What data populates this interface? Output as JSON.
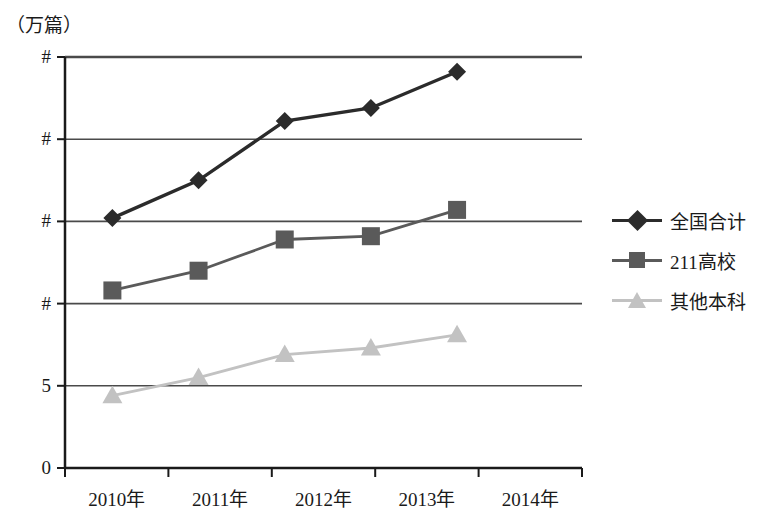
{
  "chart_data": {
    "type": "line",
    "title": "",
    "subtitle": "",
    "unit_label": "（万篇）",
    "xlabel": "",
    "ylabel": "",
    "categories": [
      "2010年",
      "2011年",
      "2012年",
      "2013年",
      "2014年"
    ],
    "ytick_labels": [
      "#",
      "#",
      "#",
      "#",
      "5",
      "0"
    ],
    "ytick_values": [
      25,
      20,
      15,
      10,
      5,
      0
    ],
    "ylim": [
      0,
      25
    ],
    "grid": true,
    "legend_position": "right",
    "series": [
      {
        "name": "全国合计",
        "marker": "diamond",
        "color": "#2b2b2b",
        "values": [
          15.2,
          17.5,
          21.1,
          21.9,
          24.1
        ]
      },
      {
        "name": "211高校",
        "marker": "square",
        "color": "#5a5a5a",
        "values": [
          10.8,
          12.0,
          13.9,
          14.1,
          15.7
        ]
      },
      {
        "name": "其他本科",
        "marker": "triangle",
        "color": "#c2c2c2",
        "values": [
          4.4,
          5.5,
          6.9,
          7.3,
          8.1
        ]
      }
    ]
  },
  "axis": {
    "x_tick_count": 6,
    "baseline_label": "0"
  },
  "legend": {
    "items": [
      {
        "label": "全国合计",
        "marker": "diamond",
        "color": "#2b2b2b"
      },
      {
        "label": "211高校",
        "marker": "square",
        "color": "#5a5a5a"
      },
      {
        "label": "其他本科",
        "marker": "triangle",
        "color": "#c2c2c2"
      }
    ]
  }
}
